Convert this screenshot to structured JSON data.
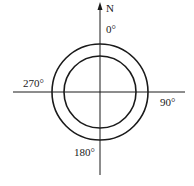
{
  "diagram": {
    "type": "compass-bearing-diagram",
    "north_label": "N",
    "bearings": {
      "top": "0°",
      "right": "90°",
      "bottom": "180°",
      "left": "270°"
    },
    "rings": [
      "outer-circle",
      "inner-circle"
    ],
    "colors": {
      "stroke": "#1a1a1a",
      "background": "#ffffff"
    }
  }
}
